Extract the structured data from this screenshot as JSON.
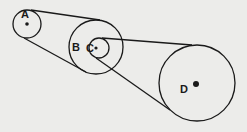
{
  "diagram": {
    "type": "belt-pulley-system",
    "labels": {
      "a": "A",
      "b": "B",
      "c": "C",
      "d": "D"
    },
    "colors": {
      "stroke": "#1a1a1a",
      "background": "#ececea"
    }
  }
}
